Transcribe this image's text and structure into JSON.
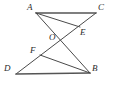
{
  "figure": {
    "canvas": {
      "width": 117,
      "height": 86
    },
    "stroke_color": "#4a4a4a",
    "label_color": "#2b2b2b",
    "background_color": "#ffffff",
    "points": [
      {
        "id": "A",
        "label": "A",
        "x": 36,
        "y": 13,
        "label_x": 27,
        "label_y": 3
      },
      {
        "id": "C",
        "label": "C",
        "x": 96,
        "y": 13,
        "label_x": 98,
        "label_y": 3
      },
      {
        "id": "E",
        "label": "E",
        "x": 80,
        "y": 27,
        "label_x": 80,
        "label_y": 28
      },
      {
        "id": "O",
        "label": "O",
        "x": 58,
        "y": 42,
        "label_x": 49,
        "label_y": 33
      },
      {
        "id": "F",
        "label": "F",
        "x": 40,
        "y": 55,
        "label_x": 30,
        "label_y": 46
      },
      {
        "id": "D",
        "label": "D",
        "x": 16,
        "y": 74,
        "label_x": 4,
        "label_y": 64
      },
      {
        "id": "B",
        "label": "B",
        "x": 90,
        "y": 73,
        "label_x": 92,
        "label_y": 64
      }
    ],
    "segments": [
      {
        "id": "AC",
        "from": "A",
        "to": "C",
        "name": "segment-a-c"
      },
      {
        "id": "AE",
        "from": "A",
        "to": "E",
        "name": "segment-a-e"
      },
      {
        "id": "AB",
        "from": "A",
        "to": "B",
        "name": "segment-a-b"
      },
      {
        "id": "DC",
        "from": "D",
        "to": "C",
        "name": "segment-d-c"
      },
      {
        "id": "DB",
        "from": "D",
        "to": "B",
        "name": "segment-d-b"
      },
      {
        "id": "FB",
        "from": "F",
        "to": "B",
        "name": "segment-f-b"
      }
    ],
    "intersections": [
      {
        "id": "O",
        "of": [
          "AB",
          "DC"
        ]
      },
      {
        "id": "E",
        "of": [
          "AE",
          "DC"
        ]
      },
      {
        "id": "F",
        "of": [
          "FB",
          "DC"
        ]
      }
    ]
  }
}
